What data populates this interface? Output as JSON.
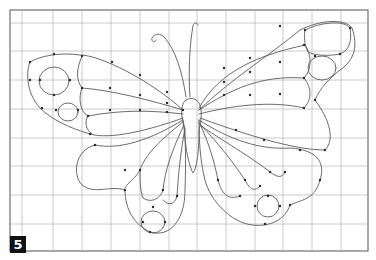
{
  "figure": {
    "step_label": "5",
    "colors": {
      "line": "#5a5a5a",
      "grid": "#bdbdbd",
      "badge_bg": "#111111",
      "badge_text": "#ffffff"
    }
  }
}
